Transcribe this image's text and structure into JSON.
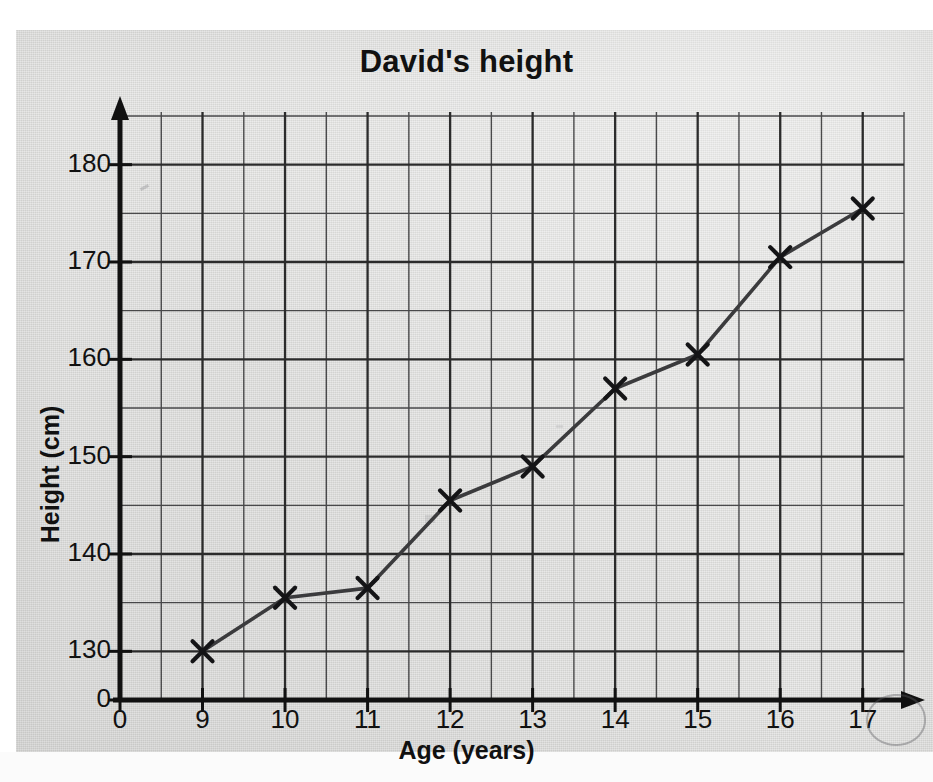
{
  "page": {
    "media": "scanned-worksheet-page",
    "paper_color": "#d9d9d7",
    "ink_color": "#111111"
  },
  "annotations": {
    "circled_tick_label": "17",
    "circle_note": "pencil ellipse drawn around the final x-axis label"
  },
  "chart_data": {
    "type": "line",
    "title": "David's height",
    "xlabel": "Age (years)",
    "ylabel": "Height (cm)",
    "x": [
      9,
      10,
      11,
      12,
      13,
      14,
      15,
      16,
      17
    ],
    "values": [
      130,
      135.5,
      136.5,
      145.5,
      149,
      157,
      160.5,
      170.5,
      175.5
    ],
    "series": [
      {
        "name": "David's height",
        "values": [
          130,
          135.5,
          136.5,
          145.5,
          149,
          157,
          160.5,
          170.5,
          175.5
        ]
      }
    ],
    "xlim": [
      8,
      17.5
    ],
    "ylim": [
      125,
      185
    ],
    "y_axis_break": true,
    "y_axis_break_label": "0",
    "xticks": [
      "0",
      "9",
      "10",
      "11",
      "12",
      "13",
      "14",
      "15",
      "16",
      "17"
    ],
    "xtick_values": [
      8,
      9,
      10,
      11,
      12,
      13,
      14,
      15,
      16,
      17
    ],
    "yticks": [
      "0",
      "130",
      "140",
      "150",
      "160",
      "170",
      "180"
    ],
    "ytick_values": [
      125,
      130,
      140,
      150,
      160,
      170,
      180
    ],
    "grid": true,
    "grid_minor_y_step": 5,
    "grid_minor_x_step": 0.5,
    "legend": false,
    "marker": "x",
    "line_color": "#3a3a3a",
    "grid_color": "#2b2b2b",
    "axis_color": "#111111"
  }
}
